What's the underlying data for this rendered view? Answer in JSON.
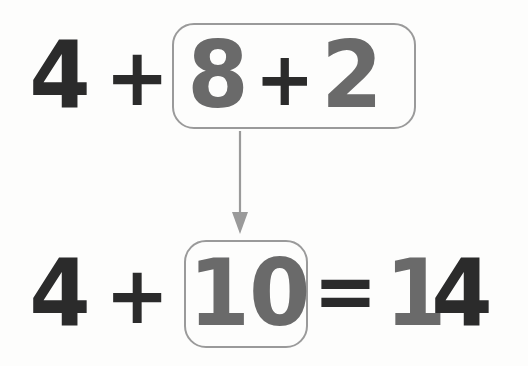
{
  "diagram": {
    "background_color": "#fdfdfc",
    "colors": {
      "dark_digit": "#2b2b2b",
      "gray_digit": "#6a6a6a",
      "box_border": "#9a9a9a",
      "arrow": "#9a9a9a"
    }
  },
  "top_row": {
    "addend": "4",
    "plus_outer": "+",
    "grouped": {
      "left_addend": "8",
      "plus_inner": "+",
      "right_addend": "2"
    }
  },
  "arrow": {
    "name": "downward-arrow",
    "direction": "down",
    "from": "grouped sum 8 + 2",
    "to": "value 10"
  },
  "bottom_row": {
    "addend": "4",
    "plus": "+",
    "grouped": {
      "value": "10"
    },
    "equals": "=",
    "result_gray": "1",
    "result_dark": "4",
    "result_full": "14"
  },
  "equation_text": {
    "step_one": "4 + 8 + 2",
    "step_two": "4 + 10 = 14"
  }
}
